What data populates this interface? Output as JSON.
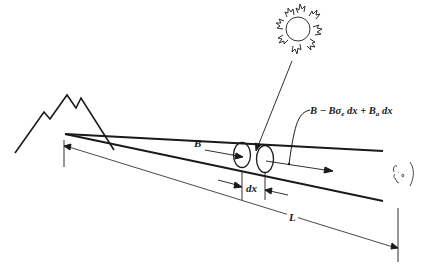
{
  "diagram": {
    "title": "",
    "elements": {
      "sun": {
        "label": "",
        "icon": "sun-icon"
      },
      "mountain": {
        "label": "",
        "icon": "mountain-icon"
      },
      "observer": {
        "label": "",
        "icon": "observer-face-icon"
      },
      "slab_start": {
        "label": "",
        "icon": "disc-icon"
      },
      "slab_end": {
        "label": "",
        "icon": "disc-icon"
      }
    },
    "labels": {
      "incoming_brightness": "B",
      "outgoing_expression_parts": {
        "p1": "B − Bσ",
        "sub1": "e",
        "p2": " dx + B",
        "sub2": "a",
        "p3": " dx"
      },
      "outgoing_expression_full": "B − Bσe dx + Ba dx",
      "slab_thickness": "dx",
      "path_length": "L"
    },
    "colors": {
      "ink": "#1a1a1a",
      "background": "#ffffff"
    }
  }
}
